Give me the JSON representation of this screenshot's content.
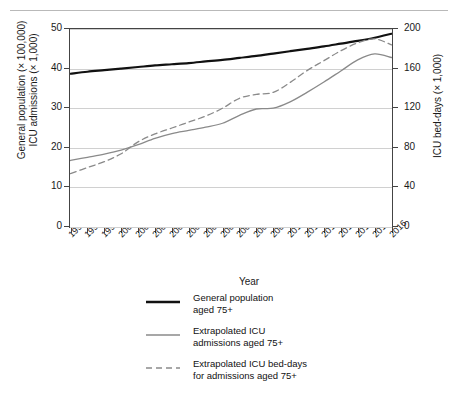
{
  "top_caption": "",
  "chart_data": {
    "type": "line",
    "title": "",
    "xlabel": "Year",
    "ylabel_left": "General population (× 100,000) ICU admissions (× 1,000)",
    "ylabel_left_line1": "General population (× 100,000)",
    "ylabel_left_line2": "ICU admissions (× 1,000)",
    "ylabel_right": "ICU bed-days (× 1,000)",
    "grid": true,
    "legend_position": "bottom",
    "categories": [
      "1997",
      "1998",
      "1999",
      "2000",
      "2001",
      "2002",
      "2003",
      "2004",
      "2005",
      "2006",
      "2007",
      "2008",
      "2009",
      "2010",
      "2011",
      "2012",
      "2013",
      "2014",
      "2015",
      "2016"
    ],
    "ylim_left": [
      0,
      50
    ],
    "yticks_left": [
      0,
      10,
      20,
      30,
      40,
      50
    ],
    "ylim_right": [
      0,
      200
    ],
    "yticks_right": [
      0,
      40,
      80,
      120,
      160,
      200
    ],
    "series": [
      {
        "name": "General population aged 75+",
        "axis": "left",
        "style": "solid",
        "color": "#111111",
        "width": 2.2,
        "values": [
          38.7,
          39.2,
          39.6,
          40.0,
          40.4,
          40.8,
          41.1,
          41.4,
          41.8,
          42.2,
          42.7,
          43.2,
          43.8,
          44.4,
          45.0,
          45.6,
          46.3,
          47.0,
          47.8,
          48.8
        ]
      },
      {
        "name": "Extrapolated ICU admissions aged 75+",
        "axis": "left",
        "style": "solid",
        "color": "#8a8a8a",
        "width": 1.3,
        "values": [
          16.8,
          17.6,
          18.4,
          19.4,
          20.8,
          22.4,
          23.6,
          24.4,
          25.2,
          26.2,
          28.2,
          29.8,
          30.0,
          31.6,
          34.0,
          36.6,
          39.4,
          42.2,
          43.7,
          42.8
        ]
      },
      {
        "name": "Extrapolated ICU bed-days for admissions aged 75+",
        "axis": "right",
        "style": "dashed",
        "color": "#8a8a8a",
        "width": 1.3,
        "values": [
          54,
          60,
          66,
          74,
          86,
          94,
          100,
          106,
          112,
          120,
          130,
          134,
          136,
          146,
          158,
          168,
          178,
          186,
          190,
          184
        ]
      }
    ]
  },
  "legend": {
    "items": [
      {
        "line1": "General population",
        "line2": "aged 75+",
        "style": "solid",
        "color": "#111111",
        "thick": true
      },
      {
        "line1": "Extrapolated ICU",
        "line2": "admissions aged 75+",
        "style": "solid",
        "color": "#8a8a8a",
        "thick": false
      },
      {
        "line1": "Extrapolated ICU bed-days",
        "line2": "for admissions aged 75+",
        "style": "dashed",
        "color": "#8a8a8a",
        "thick": false
      }
    ]
  }
}
